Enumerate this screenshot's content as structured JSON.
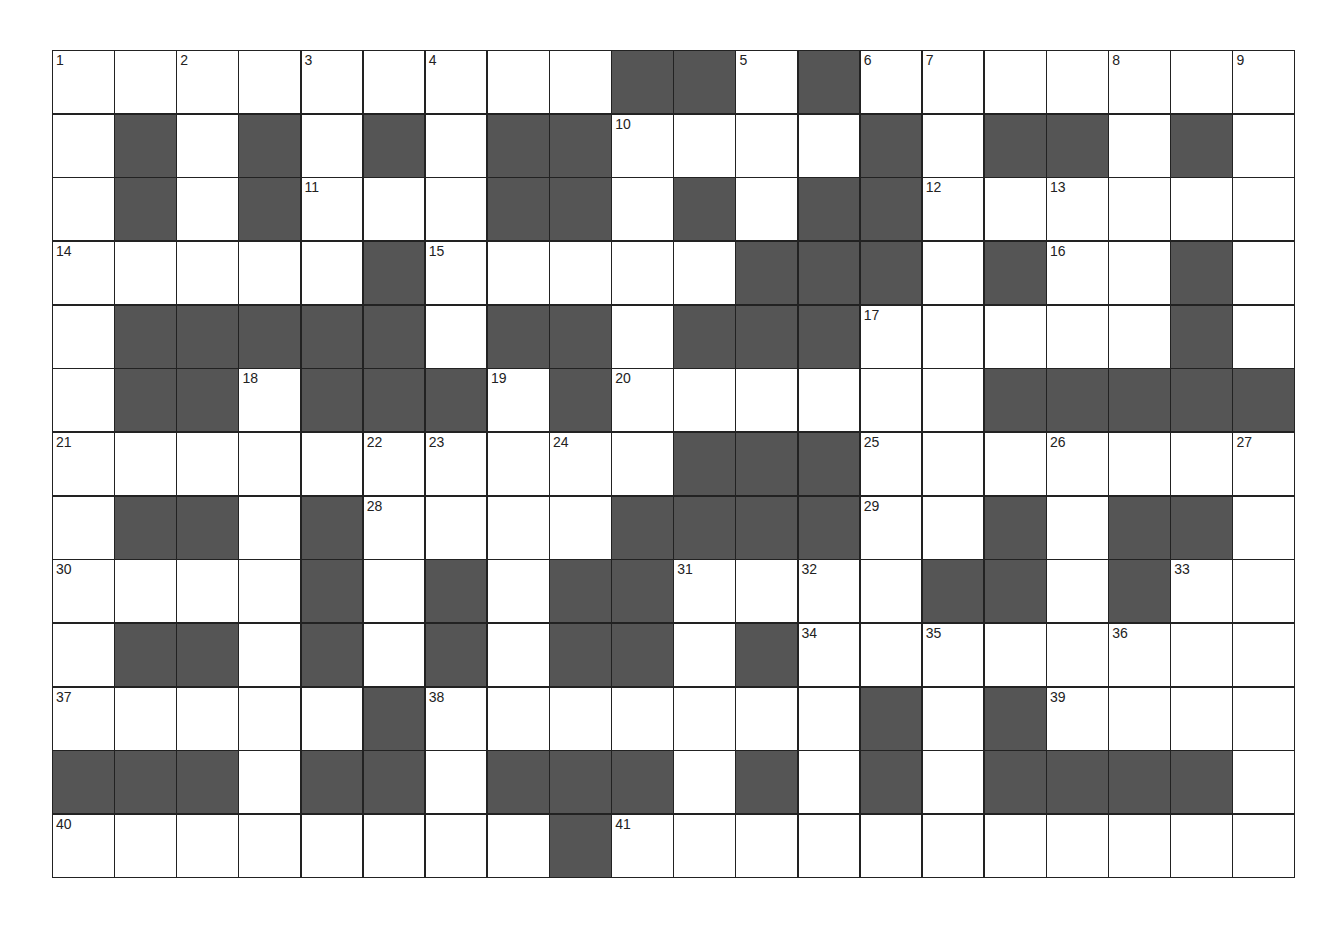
{
  "puzzle": {
    "type": "crossword",
    "columns": 20,
    "rows": 13,
    "colors": {
      "block": "#555555",
      "cell": "#ffffff",
      "grid_line": "#222222",
      "number": "#222222"
    },
    "grid": [
      [
        "1",
        "",
        "2",
        "",
        "3",
        "",
        "4",
        "",
        "",
        "#",
        "#",
        "5",
        "#",
        "6",
        "7",
        "",
        "",
        "8",
        "",
        "9"
      ],
      [
        "",
        "#",
        "",
        "#",
        "",
        "#",
        "",
        "#",
        "#",
        "10",
        "",
        "",
        "",
        "#",
        "",
        "#",
        "#",
        "",
        "#",
        ""
      ],
      [
        "",
        "#",
        "",
        "#",
        "11",
        "",
        "",
        "#",
        "#",
        "",
        "#",
        "",
        "#",
        "#",
        "12",
        "",
        "13",
        "",
        "",
        ""
      ],
      [
        "14",
        "",
        "",
        "",
        "",
        "#",
        "15",
        "",
        "",
        "",
        "",
        "#",
        "#",
        "#",
        "",
        "#",
        "16",
        "",
        "#",
        ""
      ],
      [
        "",
        "#",
        "#",
        "#",
        "#",
        "#",
        "",
        "#",
        "#",
        "",
        "#",
        "#",
        "#",
        "17",
        "",
        "",
        "",
        "",
        "#",
        ""
      ],
      [
        "",
        "#",
        "#",
        "18",
        "#",
        "#",
        "#",
        "19",
        "#",
        "20",
        "",
        "",
        "",
        "",
        "",
        "#",
        "#",
        "#",
        "#",
        "#"
      ],
      [
        "21",
        "",
        "",
        "",
        "",
        "22",
        "23",
        "",
        "24",
        "",
        "#",
        "#",
        "#",
        "25",
        "",
        "",
        "26",
        "",
        "",
        "27"
      ],
      [
        "",
        "#",
        "#",
        "",
        "#",
        "28",
        "",
        "",
        "",
        "#",
        "#",
        "#",
        "#",
        "29",
        "",
        "#",
        "",
        "#",
        "#",
        ""
      ],
      [
        "30",
        "",
        "",
        "",
        "#",
        "",
        "#",
        "",
        "#",
        "#",
        "31",
        "",
        "32",
        "",
        "#",
        "#",
        "",
        "#",
        "33",
        ""
      ],
      [
        "",
        "#",
        "#",
        "",
        "#",
        "",
        "#",
        "",
        "#",
        "#",
        "",
        "#",
        "34",
        "",
        "35",
        "",
        "",
        "36",
        "",
        ""
      ],
      [
        "37",
        "",
        "",
        "",
        "",
        "#",
        "38",
        "",
        "",
        "",
        "",
        "",
        "",
        "#",
        "",
        "#",
        "39",
        "",
        "",
        ""
      ],
      [
        "#",
        "#",
        "#",
        "",
        "#",
        "#",
        "",
        "#",
        "#",
        "#",
        "",
        "#",
        "",
        "#",
        "",
        "#",
        "#",
        "#",
        "#",
        ""
      ],
      [
        "40",
        "",
        "",
        "",
        "",
        "",
        "",
        "",
        "#",
        "41",
        "",
        "",
        "",
        "",
        "",
        "",
        "",
        "",
        "",
        ""
      ]
    ],
    "clue_numbers": [
      1,
      2,
      3,
      4,
      5,
      6,
      7,
      8,
      9,
      10,
      11,
      12,
      13,
      14,
      15,
      16,
      17,
      18,
      19,
      20,
      21,
      22,
      23,
      24,
      25,
      26,
      27,
      28,
      29,
      30,
      31,
      32,
      33,
      34,
      35,
      36,
      37,
      38,
      39,
      40,
      41
    ]
  }
}
